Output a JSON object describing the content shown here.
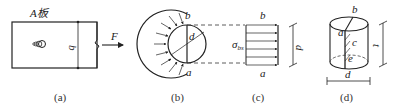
{
  "panels": {
    "a": {
      "caption": "(a)",
      "plate_label": "A板",
      "width_label": "b",
      "force_label": "F"
    },
    "b": {
      "caption": "(b)",
      "top_label": "b",
      "bottom_label": "a",
      "diameter_label": "d"
    },
    "c": {
      "caption": "(c)",
      "top_label": "b",
      "bottom_label": "a",
      "stress_label": "σ",
      "stress_sub": "bs",
      "dim_label": "d"
    },
    "d": {
      "caption": "(d)",
      "top_label": "b",
      "label_a": "a",
      "label_c": "c",
      "label_e": "e",
      "height_label": "t",
      "dia_label": "d"
    }
  },
  "colors": {
    "line": "#222222",
    "dash": "#333333"
  }
}
